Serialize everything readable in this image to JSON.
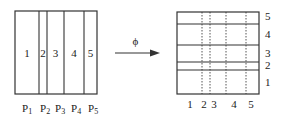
{
  "diagram": {
    "left_box": {
      "x": 15,
      "y": 11,
      "width": 82,
      "height": 83,
      "dividers_x": [
        39,
        47,
        64,
        84
      ],
      "region_labels": [
        {
          "text": "1",
          "x": 27,
          "y": 57
        },
        {
          "text": "2",
          "x": 43,
          "y": 57
        },
        {
          "text": "3",
          "x": 55.5,
          "y": 57
        },
        {
          "text": "4",
          "x": 74,
          "y": 57
        },
        {
          "text": "5",
          "x": 90.5,
          "y": 57
        }
      ],
      "bottom_labels": [
        {
          "base": "P",
          "sub": "1",
          "x": 22
        },
        {
          "base": "P",
          "sub": "2",
          "x": 40
        },
        {
          "base": "P",
          "sub": "3",
          "x": 55
        },
        {
          "base": "P",
          "sub": "4",
          "x": 71
        },
        {
          "base": "P",
          "sub": "5",
          "x": 88
        }
      ]
    },
    "arrow": {
      "label": "ϕ",
      "x1": 115,
      "x2": 160,
      "y": 53
    },
    "right_box": {
      "x": 177,
      "y": 12,
      "width": 82,
      "height": 82,
      "dividers_y": [
        24,
        45,
        62,
        70
      ],
      "dotted_x": [
        202,
        210,
        226,
        246
      ],
      "side_labels": [
        {
          "text": "5",
          "y": 20
        },
        {
          "text": "4",
          "y": 38
        },
        {
          "text": "3",
          "y": 57
        },
        {
          "text": "2",
          "y": 69
        },
        {
          "text": "1",
          "y": 86
        }
      ],
      "bottom_labels": [
        {
          "text": "1",
          "x": 190
        },
        {
          "text": "2",
          "x": 204
        },
        {
          "text": "3",
          "x": 214
        },
        {
          "text": "4",
          "x": 234
        },
        {
          "text": "5",
          "x": 251
        }
      ]
    },
    "colors": {
      "stroke": "#333333",
      "text": "#222222",
      "background": "#ffffff"
    }
  }
}
